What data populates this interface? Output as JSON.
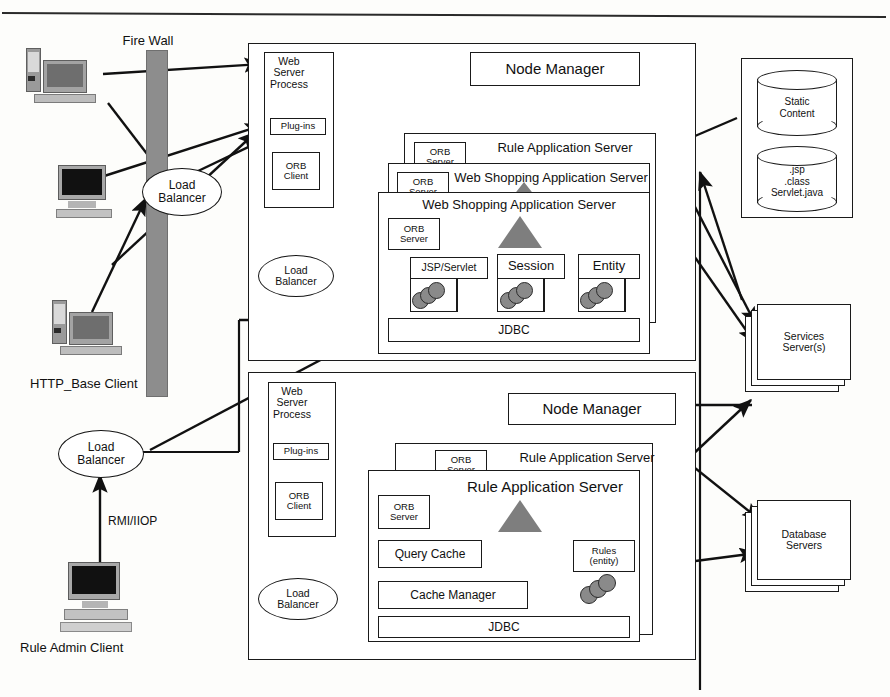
{
  "diagram": {
    "top_rule": true
  },
  "clients": {
    "firewall_label": "Fire Wall",
    "http_client_label": "HTTP_Base Client",
    "rule_admin_label": "Rule Admin Client",
    "protocol_label": "RMI/IIOP",
    "load_balancer_front": "Load\nBalancer",
    "load_balancer_admin": "Load\nBalancer",
    "workstations": [
      {
        "name": "workstation-top"
      },
      {
        "name": "workstation-middle"
      },
      {
        "name": "workstation-http-base"
      },
      {
        "name": "workstation-rule-admin"
      }
    ]
  },
  "upper_tier": {
    "node_manager": "Node Manager",
    "web_server_process": "Web\nServer\nProcess",
    "plugins": "Plug-ins",
    "orb_client": "ORB\nClient",
    "load_balancer": "Load\nBalancer",
    "app_server_stack": [
      {
        "title": "Rule Application Server",
        "orb": "ORB\nServer"
      },
      {
        "title": "Web Shopping Application Server",
        "orb": "ORB\nServer"
      },
      {
        "title": "Web Shopping Application Server",
        "orb": "ORB\nServer"
      }
    ],
    "containers": [
      "JSP/Servlet",
      "Session",
      "Entity"
    ],
    "jdbc": "JDBC"
  },
  "lower_tier": {
    "node_manager": "Node Manager",
    "web_server_process": "Web\nServer\nProcess",
    "plugins": "Plug-ins",
    "orb_client": "ORB\nClient",
    "load_balancer": "Load\nBalancer",
    "app_server_stack": [
      {
        "title": "Rule Application Server",
        "orb": "ORB\nServer"
      },
      {
        "title": "Rule Application Server",
        "orb": "ORB\nServer"
      }
    ],
    "query_cache": "Query Cache",
    "cache_manager": "Cache Manager",
    "rules_entity": "Rules\n(entity)",
    "jdbc": "JDBC"
  },
  "right_tier": {
    "content_store": {
      "static_content": "Static\nContent",
      "code_artifacts": ".jsp\n.class\nServlet.java"
    },
    "services_servers": "Services\nServer(s)",
    "database_servers": "Database\nServers"
  },
  "colors": {
    "stroke": "#1a1a1a",
    "firewall_fill": "#8d8d8d",
    "bean_fill": "#8a8a8a",
    "triangle_fill": "#7e7e7e",
    "background": "#fdfdfb"
  }
}
